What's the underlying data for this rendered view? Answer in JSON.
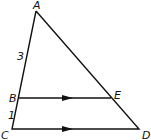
{
  "diagram": {
    "type": "triangle-with-parallel-segment",
    "points": {
      "A": {
        "label": "A",
        "x": 36,
        "y": 11
      },
      "B": {
        "label": "B",
        "x": 19,
        "y": 98
      },
      "C": {
        "label": "C",
        "x": 12,
        "y": 129
      },
      "D": {
        "label": "D",
        "x": 139,
        "y": 129
      },
      "E": {
        "label": "E",
        "x": 111,
        "y": 98
      }
    },
    "segment_labels": {
      "AB": "3",
      "BC": "1"
    },
    "parallel_segments": [
      "BE",
      "CD"
    ],
    "stroke_color": "#111111"
  }
}
